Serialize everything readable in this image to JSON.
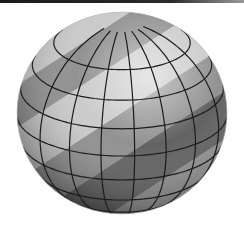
{
  "scene": {
    "subject": "Shaded sphere with latitude/longitude grid and diagonal bands",
    "sphere": {
      "cx": 122,
      "cy": 113,
      "rx": 105,
      "ry": 101
    },
    "colors": {
      "background": "#ffffff",
      "grid_line": "#1c1c1c",
      "band_dark": "#5a5a5a",
      "band_mid": "#8c8c8c",
      "band_light": "#c8c8c8",
      "highlight": "#f2f2f2"
    },
    "latitudes": [
      -0.82,
      -0.58,
      -0.3,
      -0.02,
      0.26,
      0.52,
      0.76
    ],
    "longitudes": [
      -0.78,
      -0.5,
      -0.2,
      0.12,
      0.42,
      0.7,
      0.92
    ],
    "bands": [
      {
        "offset": -150,
        "width": 40,
        "shade": "band_dark"
      },
      {
        "offset": -110,
        "width": 30,
        "shade": "band_light"
      },
      {
        "offset": -80,
        "width": 35,
        "shade": "band_mid"
      },
      {
        "offset": -45,
        "width": 45,
        "shade": "band_light"
      },
      {
        "offset": 0,
        "width": 38,
        "shade": "band_mid"
      },
      {
        "offset": 38,
        "width": 40,
        "shade": "band_dark"
      },
      {
        "offset": 78,
        "width": 45,
        "shade": "band_mid"
      },
      {
        "offset": 123,
        "width": 60,
        "shade": "band_dark"
      }
    ]
  }
}
